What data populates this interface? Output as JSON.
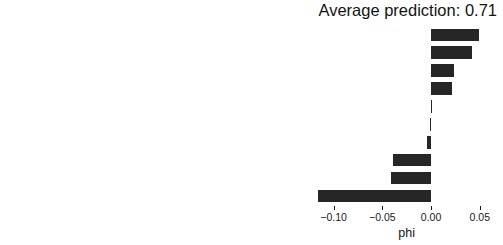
{
  "chart_data": {
    "type": "bar",
    "orientation": "horizontal",
    "title": "Average prediction: 0.71",
    "xlabel": "phi",
    "ylabel": "",
    "grid": false,
    "legend": null,
    "xlim": [
      -0.1283,
      0.0666
    ],
    "xticks": [
      -0.1,
      -0.05,
      0.0,
      0.05
    ],
    "xtick_labels": [
      "−0.10",
      "−0.05",
      "0.00",
      "0.05"
    ],
    "bar_color": "#262626",
    "categories": [
      "duration=12",
      "purpose=furniture/equipment",
      "property=unknown / no property",
      "age=40",
      "other_debtors=none",
      "credit_history=no credits taken/all credits paid back duly",
      "employment_duration=1 <= ... < 4 yrs",
      "savings=unknown/no savings account",
      "amount=701",
      "status=no checking account"
    ],
    "values": [
      0.049,
      0.042,
      0.024,
      0.021,
      0.0,
      -0.001,
      -0.004,
      -0.039,
      -0.041,
      -0.116
    ]
  }
}
